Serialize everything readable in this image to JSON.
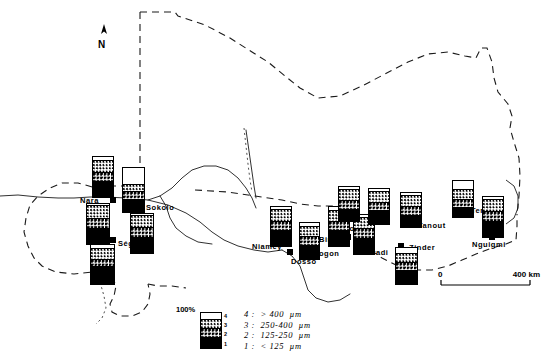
{
  "map": {
    "title": "Sahel grain-size distribution map",
    "north_arrow_label": "N",
    "scale": {
      "start": "0",
      "end": "400 km"
    },
    "cities": [
      {
        "name": "Nara",
        "label_x": 80,
        "label_y": 196,
        "dot_x": 110,
        "dot_y": 197
      },
      {
        "name": "Sokolo",
        "label_x": 146,
        "label_y": 203,
        "dot_x": 133,
        "dot_y": 203
      },
      {
        "name": "Ségou",
        "label_x": 118,
        "label_y": 239,
        "dot_x": 110,
        "dot_y": 237
      },
      {
        "name": "Niamey",
        "label_x": 252,
        "label_y": 242,
        "dot_x": 284,
        "dot_y": 240
      },
      {
        "name": "Dosso",
        "label_x": 291,
        "label_y": 257,
        "dot_x": 287,
        "dot_y": 249
      },
      {
        "name": "Dogon",
        "label_x": 313,
        "label_y": 249,
        "dot_x": 306,
        "dot_y": 243
      },
      {
        "name": "Birni",
        "label_x": 319,
        "label_y": 235,
        "dot_x": 345,
        "dot_y": 234
      },
      {
        "name": "Tahoua",
        "label_x": 335,
        "label_y": 224,
        "dot_x": 330,
        "dot_y": 217
      },
      {
        "name": "Maradi",
        "label_x": 361,
        "label_y": 248,
        "dot_x": 363,
        "dot_y": 240
      },
      {
        "name": "Tanout",
        "label_x": 418,
        "label_y": 221,
        "dot_x": 406,
        "dot_y": 221
      },
      {
        "name": "Zinder",
        "label_x": 409,
        "label_y": 243,
        "dot_x": 398,
        "dot_y": 243
      },
      {
        "name": "Termit",
        "label_x": 471,
        "label_y": 206,
        "dot_x": 460,
        "dot_y": 206
      },
      {
        "name": "Nguigmi",
        "label_x": 472,
        "label_y": 240,
        "dot_x": 489,
        "dot_y": 234
      }
    ]
  },
  "chart_data": {
    "type": "bar",
    "unit": "%",
    "ylim": [
      0,
      100
    ],
    "classes": [
      {
        "id": "4",
        "label": "4 :  > 400  µm",
        "pattern": "white"
      },
      {
        "id": "3",
        "label": "3 :  250-400  µm",
        "pattern": "fine-dots"
      },
      {
        "id": "2",
        "label": "2 :  125-250  µm",
        "pattern": "coarse-dots"
      },
      {
        "id": "1",
        "label": "1 :  < 125  µm",
        "pattern": "black"
      }
    ],
    "series_order": [
      "4",
      "3",
      "2",
      "1"
    ],
    "sites": [
      {
        "name": "Nara-north",
        "x": 92,
        "y": 156,
        "w": 22,
        "h": 42,
        "values": [
          8,
          30,
          22,
          40
        ]
      },
      {
        "name": "Sokolo-bar",
        "x": 122,
        "y": 167,
        "w": 23,
        "h": 46,
        "values": [
          40,
          14,
          16,
          30
        ]
      },
      {
        "name": "Nara-bar",
        "x": 86,
        "y": 203,
        "w": 24,
        "h": 42,
        "values": [
          4,
          31,
          24,
          41
        ]
      },
      {
        "name": "Sokolo-se",
        "x": 130,
        "y": 213,
        "w": 24,
        "h": 41,
        "values": [
          4,
          28,
          25,
          43
        ]
      },
      {
        "name": "Segou-bar",
        "x": 90,
        "y": 244,
        "w": 25,
        "h": 41,
        "values": [
          9,
          26,
          18,
          47
        ]
      },
      {
        "name": "Niamey-bar",
        "x": 270,
        "y": 206,
        "w": 22,
        "h": 41,
        "values": [
          6,
          30,
          22,
          42
        ]
      },
      {
        "name": "Dosso-bar",
        "x": 299,
        "y": 222,
        "w": 21,
        "h": 38,
        "values": [
          9,
          28,
          24,
          39
        ]
      },
      {
        "name": "Dogon-bar",
        "x": 328,
        "y": 206,
        "w": 22,
        "h": 41,
        "values": [
          7,
          30,
          22,
          41
        ]
      },
      {
        "name": "Birni-bar",
        "x": 353,
        "y": 214,
        "w": 22,
        "h": 41,
        "values": [
          6,
          27,
          24,
          43
        ]
      },
      {
        "name": "Tahoua-bar",
        "x": 338,
        "y": 186,
        "w": 22,
        "h": 36,
        "values": [
          5,
          33,
          26,
          36
        ]
      },
      {
        "name": "Maradi-bar",
        "x": 368,
        "y": 188,
        "w": 22,
        "h": 37,
        "values": [
          6,
          30,
          24,
          40
        ]
      },
      {
        "name": "Tanout-bar",
        "x": 400,
        "y": 192,
        "w": 22,
        "h": 36,
        "values": [
          5,
          34,
          24,
          37
        ]
      },
      {
        "name": "Zinder-bar",
        "x": 395,
        "y": 247,
        "w": 23,
        "h": 38,
        "values": [
          16,
          24,
          22,
          38
        ]
      },
      {
        "name": "Termit-bar",
        "x": 452,
        "y": 180,
        "w": 22,
        "h": 38,
        "values": [
          23,
          27,
          22,
          28
        ]
      },
      {
        "name": "Nguigmi-bar",
        "x": 482,
        "y": 196,
        "w": 22,
        "h": 42,
        "values": [
          5,
          30,
          25,
          40
        ]
      }
    ],
    "legend": {
      "percent_label": "100%",
      "tick_labels": [
        "4",
        "3",
        "2",
        "1"
      ],
      "box_values": [
        18,
        26,
        24,
        32
      ]
    }
  }
}
